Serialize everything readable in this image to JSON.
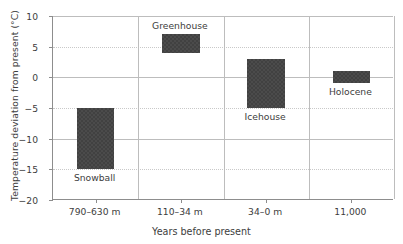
{
  "chart_data": {
    "type": "bar",
    "title": "",
    "xlabel": "Years before present",
    "ylabel": "Temperature deviation from present (°C)",
    "ylim": [
      -20,
      10
    ],
    "yticks": [
      10,
      5,
      0,
      -5,
      -10,
      -15,
      -20
    ],
    "ytick_labels": [
      "10",
      "5",
      "0",
      "−5",
      "−10",
      "−15",
      "−20"
    ],
    "grid": true,
    "legend": "none",
    "categories": [
      "790–630 m",
      "110–34 m",
      "34–0 m",
      "11,000"
    ],
    "bar_style": "floating range bars (low to high)",
    "bars": [
      {
        "category": "790–630 m",
        "annotation": "Snowball",
        "annotation_position": "below",
        "low": -15,
        "high": -5
      },
      {
        "category": "110–34 m",
        "annotation": "Greenhouse",
        "annotation_position": "above",
        "low": 4,
        "high": 7
      },
      {
        "category": "34–0 m",
        "annotation": "Icehouse",
        "annotation_position": "below",
        "low": -5,
        "high": 3
      },
      {
        "category": "11,000",
        "annotation": "Holocene",
        "annotation_position": "below",
        "low": -1,
        "high": 1
      }
    ],
    "colors": {
      "bar": "#414141",
      "axis": "#8d8d8d",
      "grid": "#bdbdbd",
      "text": "#3d3d3d",
      "background": "#ffffff"
    }
  }
}
